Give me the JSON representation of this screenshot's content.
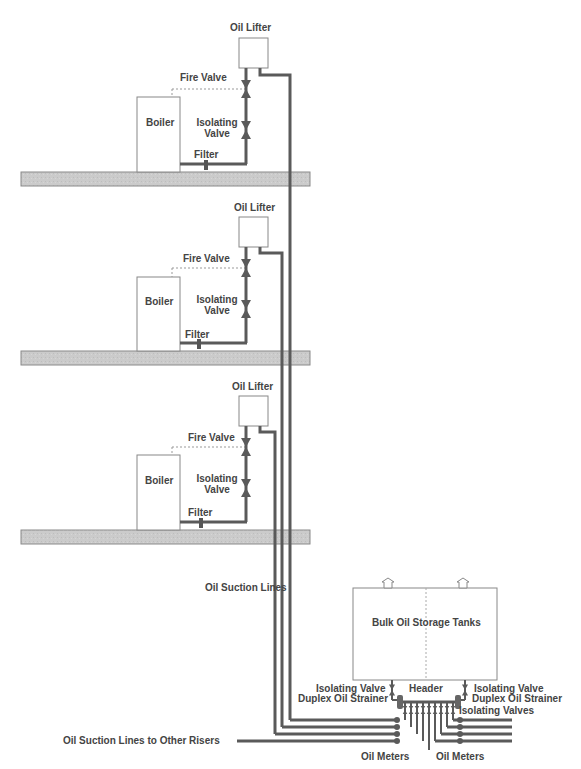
{
  "diagram": {
    "colors": {
      "pipe": "#5a5a5a",
      "slab_fill": "#c8c8c8",
      "slab_stroke": "#8a8a8a",
      "box_stroke": "#888888",
      "text": "#444444"
    },
    "floors": [
      {
        "oil_lifter": "Oil Lifter",
        "fire_valve": "Fire Valve",
        "boiler": "Boiler",
        "isolating_valve_1": "Isolating",
        "isolating_valve_2": "Valve",
        "filter": "Filter"
      },
      {
        "oil_lifter": "Oil Lifter",
        "fire_valve": "Fire Valve",
        "boiler": "Boiler",
        "isolating_valve_1": "Isolating",
        "isolating_valve_2": "Valve",
        "filter": "Filter"
      },
      {
        "oil_lifter": "Oil Lifter",
        "fire_valve": "Fire Valve",
        "boiler": "Boiler",
        "isolating_valve_1": "Isolating",
        "isolating_valve_2": "Valve",
        "filter": "Filter"
      }
    ],
    "oil_suction_lines": "Oil Suction Lines",
    "bulk_tanks": "Bulk Oil Storage Tanks",
    "header": "Header",
    "left_isolating_valve": "Isolating Valve",
    "left_strainer": "Duplex Oil Strainer",
    "right_isolating_valve": "Isolating Valve",
    "right_strainer": "Duplex Oil Strainer",
    "isolating_valves": "Isolating Valves",
    "oil_meters_left": "Oil Meters",
    "oil_meters_right": "Oil Meters",
    "other_risers": "Oil Suction Lines to Other Risers"
  }
}
